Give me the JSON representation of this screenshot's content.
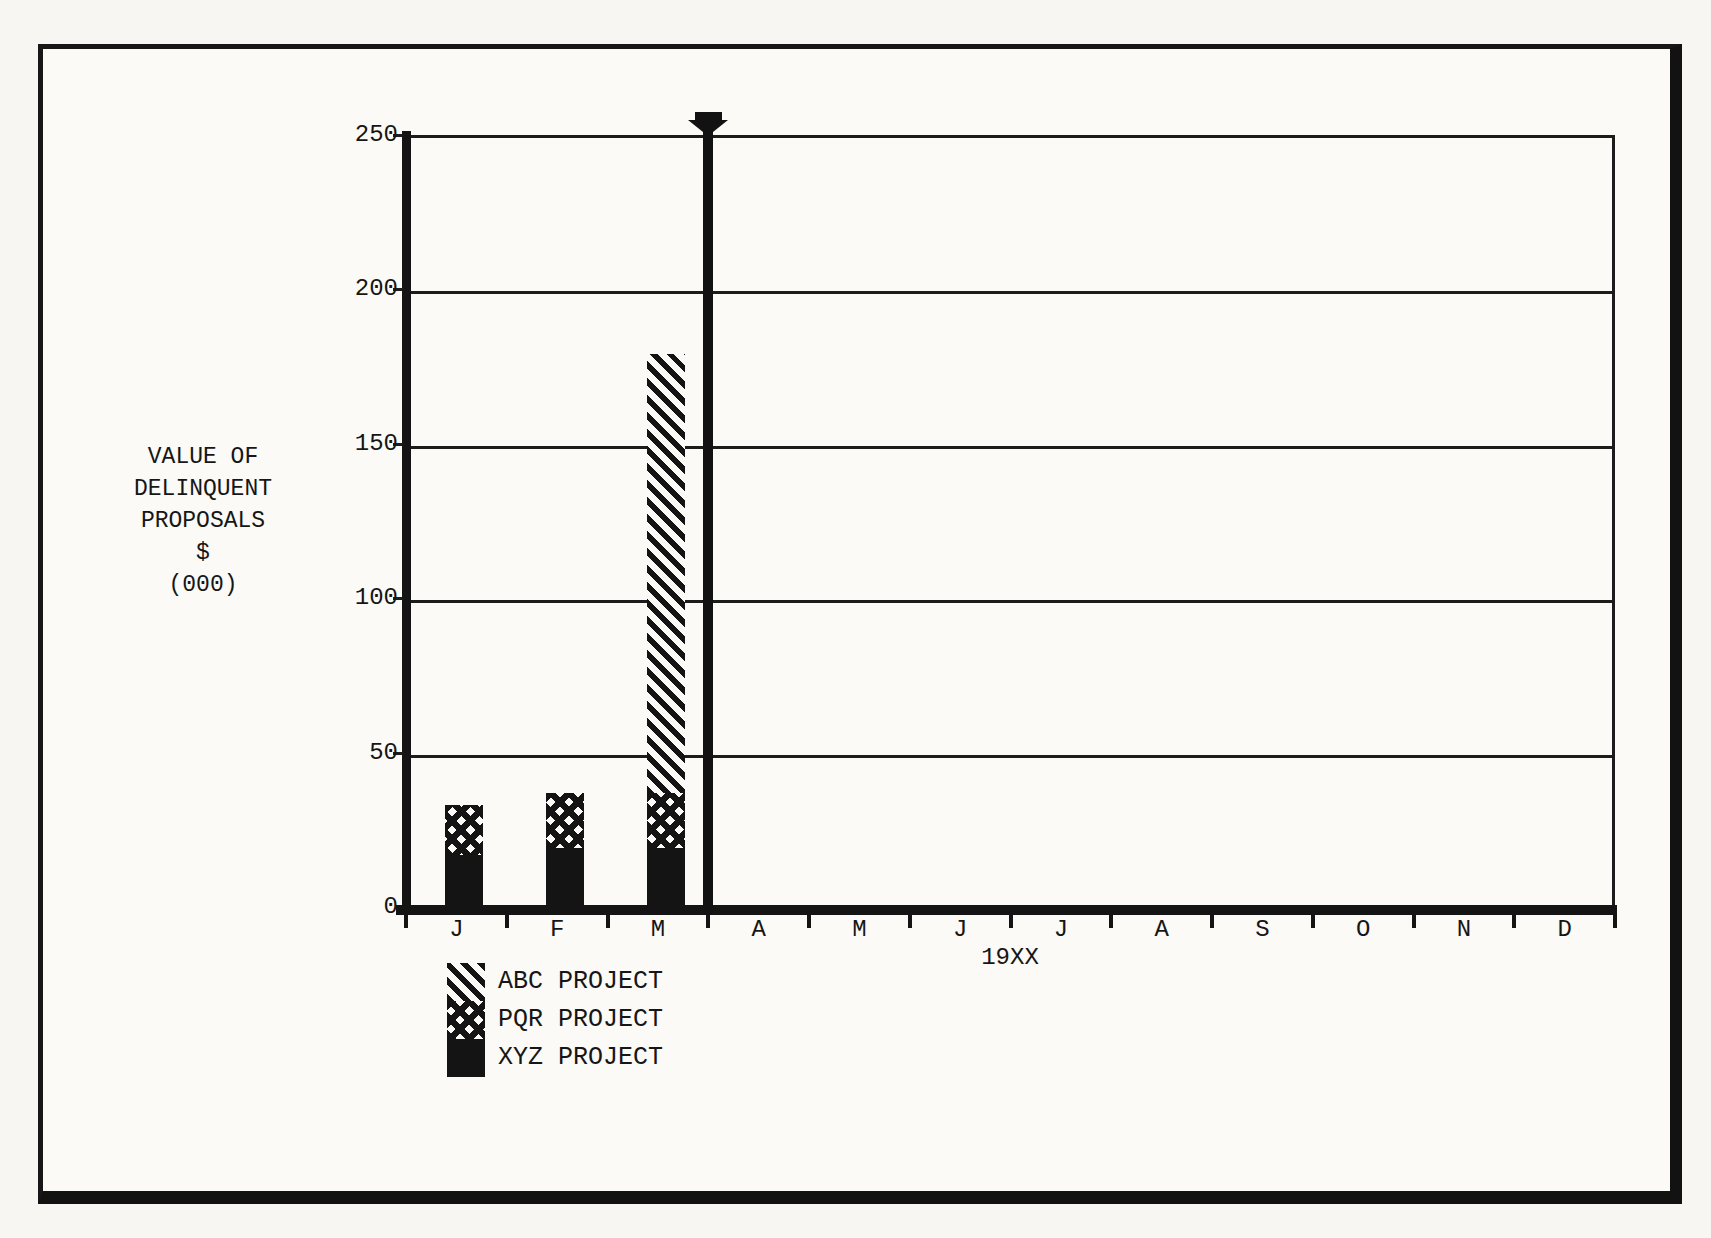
{
  "page": {
    "paper_color": "#fbfaf6",
    "ink_color": "#141414"
  },
  "chart_data": {
    "type": "bar",
    "stacked": true,
    "title": "VALUE OF DELINQUENT PROPOSALS $ (000)",
    "ylabel_lines": [
      "VALUE OF",
      "DELINQUENT",
      "PROPOSALS",
      "$",
      "(000)"
    ],
    "xlabel": "19XX",
    "categories": [
      "J",
      "F",
      "M",
      "A",
      "M",
      "J",
      "J",
      "A",
      "S",
      "O",
      "N",
      "D"
    ],
    "ylim": [
      0,
      250
    ],
    "yticks": [
      0,
      50,
      100,
      150,
      200,
      250
    ],
    "grid": "horizontal lines every 50",
    "legend_position": "below chart, left",
    "series": [
      {
        "name": "XYZ PROJECT",
        "pattern": "solid-black",
        "values": [
          17,
          19,
          19,
          0,
          0,
          0,
          0,
          0,
          0,
          0,
          0,
          0
        ]
      },
      {
        "name": "PQR PROJECT",
        "pattern": "crosshatch",
        "values": [
          16,
          18,
          18,
          0,
          0,
          0,
          0,
          0,
          0,
          0,
          0,
          0
        ]
      },
      {
        "name": "ABC PROJECT",
        "pattern": "diagonal-hatch",
        "values": [
          0,
          0,
          142,
          0,
          0,
          0,
          0,
          0,
          0,
          0,
          0,
          0
        ]
      }
    ],
    "legend": [
      {
        "label": "ABC PROJECT",
        "pattern": "diagonal-hatch"
      },
      {
        "label": "PQR PROJECT",
        "pattern": "crosshatch"
      },
      {
        "label": "XYZ PROJECT",
        "pattern": "solid-black"
      }
    ],
    "now_marker": {
      "after_category_index": 2,
      "style": "thick vertical line with solid down-arrow at top"
    }
  }
}
